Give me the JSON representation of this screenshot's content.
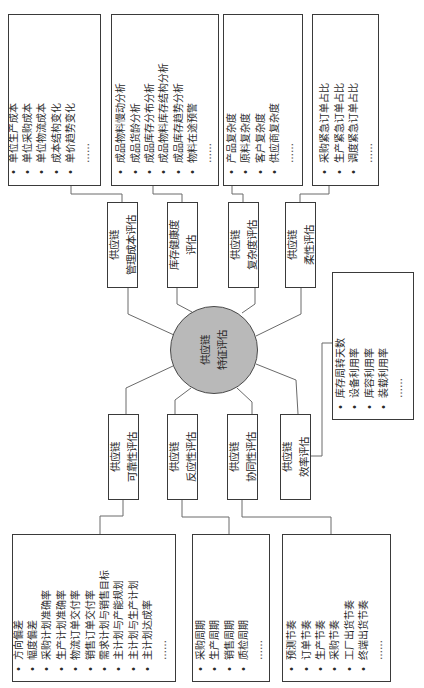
{
  "center": {
    "lines": [
      "供应链",
      "特征评估"
    ],
    "fill": "#b9b9b9"
  },
  "evaluations": [
    {
      "id": "cost",
      "lines": [
        "供应链",
        "管理成本评估"
      ],
      "metrics": [
        "单位生产成本",
        "单位采购成本",
        "单位物流成本",
        "成本结构变化",
        "单价趋势变化",
        "……"
      ]
    },
    {
      "id": "inventory",
      "lines": [
        "库存健康度",
        "评估"
      ],
      "metrics": [
        "成品物料慢动分析",
        "成品货龄分析",
        "成品库存分布分析",
        "成品物料库存结构分析",
        "成品库存趋势分析",
        "物料在途预警",
        "……"
      ]
    },
    {
      "id": "complexity",
      "lines": [
        "供应链",
        "复杂度评估"
      ],
      "metrics": [
        "产品复杂度",
        "原料复杂度",
        "客户复杂度",
        "供应商复杂度",
        "……"
      ]
    },
    {
      "id": "flexibility",
      "lines": [
        "供应链",
        "柔性评估"
      ],
      "metrics": [
        "采购紧急订单占比",
        "生产紧急订单占比",
        "调度紧急订单占比",
        "……"
      ]
    },
    {
      "id": "reliability",
      "lines": [
        "供应链",
        "可靠性评估"
      ],
      "metrics": [
        "方向偏差",
        "幅度偏差",
        "采购计划准确率",
        "生产计划准确率",
        "物流订单交付率",
        "销售订单交付率",
        "需求计划与销售目标",
        "主计划与产能规划",
        "主计划与生产计划",
        "主计划达成率",
        "……"
      ]
    },
    {
      "id": "responsiveness",
      "lines": [
        "供应链",
        "反应性评估"
      ],
      "metrics": [
        "采购周期",
        "生产周期",
        "销售周期",
        "质检周期",
        "……"
      ]
    },
    {
      "id": "synergy",
      "lines": [
        "供应链",
        "协同性评估"
      ],
      "metrics": [
        "预测节奏",
        "订单节奏",
        "生产节奏",
        "采购节奏",
        "工厂出货节奏",
        "终端出货节奏",
        "……"
      ]
    },
    {
      "id": "efficiency",
      "lines": [
        "供应链",
        "效率评估"
      ],
      "metrics": [
        "库存周转天数",
        "设备利用率",
        "库容利用率",
        "装载利用率",
        "……"
      ]
    }
  ],
  "bullet": "•",
  "colors": {
    "line": "#555555",
    "border": "#3a3a3a",
    "circle": "#b9b9b9"
  }
}
